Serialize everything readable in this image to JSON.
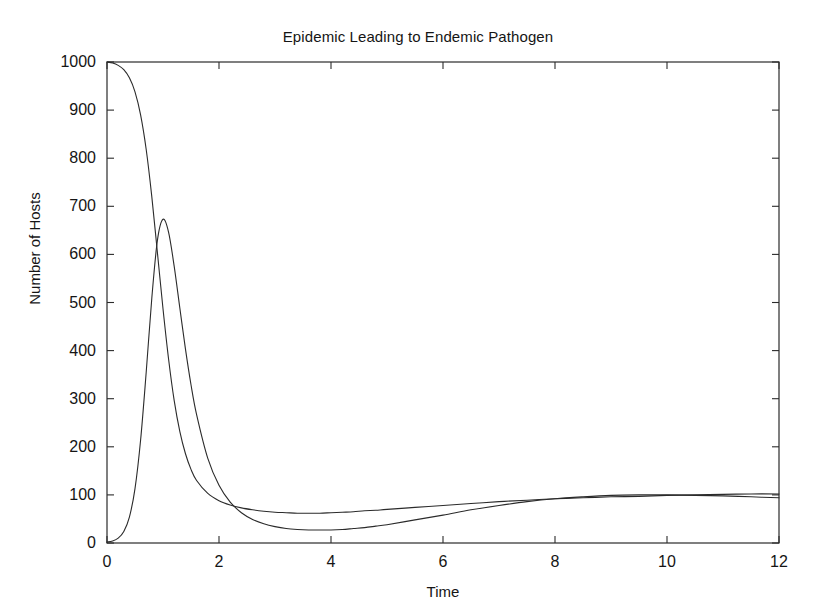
{
  "chart_data": {
    "type": "line",
    "title": "Epidemic Leading to Endemic Pathogen",
    "xlabel": "Time",
    "ylabel": "Number of Hosts",
    "xlim": [
      0,
      12
    ],
    "ylim": [
      0,
      1000
    ],
    "xticks": [
      0,
      2,
      4,
      6,
      8,
      10,
      12
    ],
    "yticks": [
      0,
      100,
      200,
      300,
      400,
      500,
      600,
      700,
      800,
      900,
      1000
    ],
    "xtick_labels": [
      "0",
      "2",
      "4",
      "6",
      "8",
      "10",
      "12"
    ],
    "ytick_labels": [
      "0",
      "100",
      "200",
      "300",
      "400",
      "500",
      "600",
      "700",
      "800",
      "900",
      "1000"
    ],
    "grid": false,
    "legend": null,
    "line_color": "#2b2b2b",
    "line_width": 1.1,
    "background": "#ffffff",
    "series": [
      {
        "name": "Susceptible Hosts",
        "x": [
          0,
          0.1,
          0.2,
          0.3,
          0.4,
          0.5,
          0.6,
          0.7,
          0.8,
          0.9,
          1.0,
          1.1,
          1.2,
          1.3,
          1.4,
          1.5,
          1.6,
          1.8,
          2.0,
          2.2,
          2.4,
          2.6,
          2.8,
          3.0,
          3.2,
          3.4,
          3.6,
          3.8,
          4.0,
          4.2,
          4.4,
          4.6,
          4.8,
          5.0,
          5.5,
          6.0,
          6.5,
          7.0,
          7.5,
          8.0,
          8.5,
          9.0,
          9.5,
          10.0,
          10.5,
          11.0,
          11.5,
          12.0
        ],
        "values": [
          1000,
          998,
          993,
          984,
          967,
          938,
          890,
          818,
          720,
          604,
          487,
          382,
          296,
          232,
          186,
          153,
          130,
          103,
          88,
          79,
          73,
          69,
          66,
          64,
          63,
          62,
          62,
          62,
          63,
          64,
          65,
          67,
          68,
          70,
          74,
          78,
          82,
          86,
          89,
          92,
          94,
          96,
          97,
          99,
          100,
          101,
          102,
          102
        ]
      },
      {
        "name": "Infected Hosts",
        "x": [
          0,
          0.1,
          0.2,
          0.3,
          0.4,
          0.5,
          0.6,
          0.7,
          0.8,
          0.9,
          1.0,
          1.1,
          1.2,
          1.3,
          1.4,
          1.5,
          1.6,
          1.8,
          2.0,
          2.2,
          2.4,
          2.6,
          2.8,
          3.0,
          3.2,
          3.4,
          3.6,
          3.8,
          4.0,
          4.2,
          4.4,
          4.6,
          4.8,
          5.0,
          5.5,
          6.0,
          6.5,
          7.0,
          7.5,
          8.0,
          8.5,
          9.0,
          9.5,
          10.0,
          10.5,
          11.0,
          11.5,
          12.0
        ],
        "values": [
          2,
          4,
          10,
          24,
          54,
          113,
          214,
          355,
          509,
          629,
          673,
          646,
          575,
          489,
          404,
          329,
          267,
          176,
          120,
          85,
          63,
          49,
          40,
          34,
          30,
          28,
          27,
          27,
          27,
          28,
          30,
          32,
          35,
          38,
          48,
          58,
          69,
          78,
          86,
          92,
          96,
          99,
          100,
          100,
          99,
          98,
          96,
          94
        ]
      }
    ],
    "annotations": {
      "infected_peak": {
        "x": 1.0,
        "y": 675
      },
      "infected_trough": {
        "x": 2.0,
        "y": 12
      },
      "curve_crossing_early": {
        "x": 0.87,
        "y": 460
      },
      "curve_crossing_late": {
        "x": 4.6,
        "y": 78
      }
    }
  },
  "axes": {
    "tick_direction": "in",
    "frame": "box"
  }
}
